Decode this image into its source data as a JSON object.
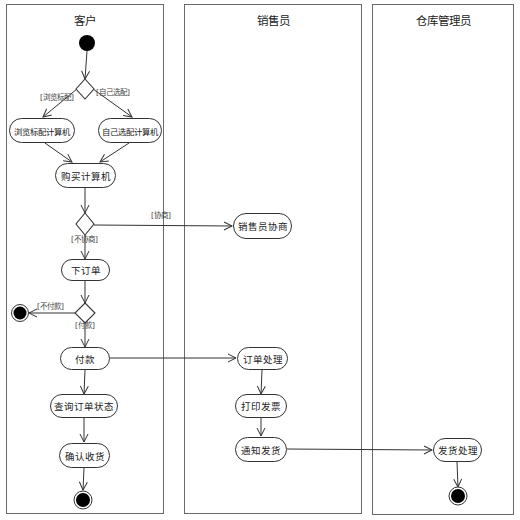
{
  "diagram": {
    "type": "UML activity diagram with swimlanes",
    "lanes": [
      {
        "title": "客户"
      },
      {
        "title": "销售员"
      },
      {
        "title": "仓库管理员"
      }
    ],
    "nodes": {
      "browse_standard": "浏览标配计算机",
      "self_config": "自己选配计算机",
      "buy_computer": "购买计算机",
      "place_order": "下订单",
      "pay": "付款",
      "query_order_status": "查询订单状态",
      "confirm_receipt": "确认收货",
      "sales_negotiation": "销售员协商",
      "order_processing": "订单处理",
      "print_invoice": "打印发票",
      "notify_shipping": "通知发货",
      "shipping_processing": "发货处理"
    },
    "guards": {
      "browse_standard": "[浏览标配]",
      "self_config": "[自己选配]",
      "negotiate": "[协商]",
      "no_negotiate": "[不协商]",
      "no_pay": "[不付款]",
      "pay": "[付款]"
    }
  }
}
